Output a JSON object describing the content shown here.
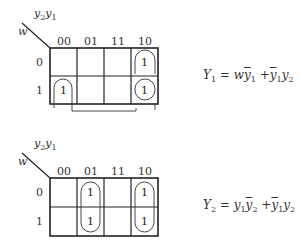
{
  "maps": [
    {
      "id": "Y1",
      "row_var": "w",
      "col_vars": {
        "a": "y",
        "a_sub": "2",
        "b": "y",
        "b_sub": "1"
      },
      "col_headers": [
        "00",
        "01",
        "11",
        "10"
      ],
      "row_headers": [
        "0",
        "1"
      ],
      "cells": [
        [
          "",
          "",
          "",
          "1"
        ],
        [
          "1",
          "",
          "",
          "1"
        ]
      ],
      "groups": [
        {
          "cells": [
            [
              0,
              3
            ],
            [
              1,
              3
            ]
          ],
          "desc": "column 10 pair"
        },
        {
          "cells": [
            [
              1,
              0
            ],
            [
              1,
              3
            ]
          ],
          "desc": "row 1 wrap-around pair (00,10)"
        }
      ],
      "equation": {
        "lhs": "Y",
        "lhs_sub": "1",
        "rhs_text": "wȳ1 + ȳ1y2"
      }
    },
    {
      "id": "Y2",
      "row_var": "w",
      "col_vars": {
        "a": "y",
        "a_sub": "2",
        "b": "y",
        "b_sub": "1"
      },
      "col_headers": [
        "00",
        "01",
        "11",
        "10"
      ],
      "row_headers": [
        "0",
        "1"
      ],
      "cells": [
        [
          "",
          "1",
          "",
          "1"
        ],
        [
          "",
          "1",
          "",
          "1"
        ]
      ],
      "groups": [
        {
          "cells": [
            [
              0,
              1
            ],
            [
              1,
              1
            ]
          ],
          "desc": "column 01 pair"
        },
        {
          "cells": [
            [
              0,
              3
            ],
            [
              1,
              3
            ]
          ],
          "desc": "column 10 pair"
        }
      ],
      "equation": {
        "lhs": "Y",
        "lhs_sub": "2",
        "rhs_text": "y1ȳ2 + ȳ1y2"
      }
    }
  ],
  "text": {
    "eq_sign": "=",
    "plus": "+",
    "y": "y",
    "w": "w",
    "one": "1",
    "two": "2",
    "Y": "Y"
  },
  "colors": {
    "line": "#222222",
    "text": "#333333",
    "background": "#ffffff"
  }
}
